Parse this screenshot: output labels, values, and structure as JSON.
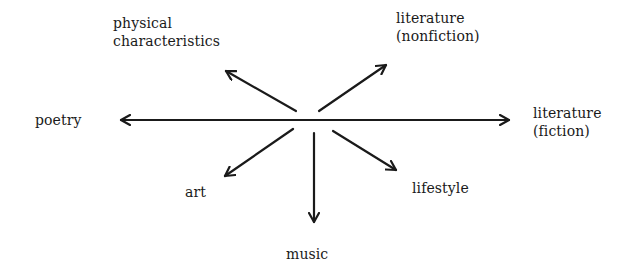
{
  "diagram": {
    "type": "radial-arrow-diagram",
    "ink_color": "#1a1a1a",
    "background": "#ffffff",
    "center": {
      "x": 314,
      "y": 120
    },
    "nodes": [
      {
        "id": "physical",
        "lines": [
          "physical",
          "characteristics"
        ],
        "direction": "up-left"
      },
      {
        "id": "lit-nonfiction",
        "lines": [
          "literature",
          "(nonfiction)"
        ],
        "direction": "up-right"
      },
      {
        "id": "poetry",
        "lines": [
          "poetry"
        ],
        "direction": "left"
      },
      {
        "id": "lit-fiction",
        "lines": [
          "literature",
          "(fiction)"
        ],
        "direction": "right"
      },
      {
        "id": "art",
        "lines": [
          "art"
        ],
        "direction": "down-left"
      },
      {
        "id": "lifestyle",
        "lines": [
          "lifestyle"
        ],
        "direction": "down-right"
      },
      {
        "id": "music",
        "lines": [
          "music"
        ],
        "direction": "down"
      }
    ]
  },
  "labels": {
    "physical": {
      "line1": "physical",
      "line2": "characteristics"
    },
    "lit_nonfiction": {
      "line1": "literature",
      "line2": "(nonfiction)"
    },
    "poetry": {
      "line1": "poetry"
    },
    "lit_fiction": {
      "line1": "literature",
      "line2": "(fiction)"
    },
    "art": {
      "line1": "art"
    },
    "lifestyle": {
      "line1": "lifestyle"
    },
    "music": {
      "line1": "music"
    }
  },
  "arrows": [
    {
      "name": "poetry-fiction-axis",
      "from": [
        121,
        120
      ],
      "to": [
        509,
        120
      ],
      "bidirectional": true
    },
    {
      "name": "arrow-physical",
      "from": [
        296,
        111
      ],
      "to": [
        226,
        71
      ]
    },
    {
      "name": "arrow-lit-nonfiction",
      "from": [
        319,
        111
      ],
      "to": [
        386,
        65
      ]
    },
    {
      "name": "arrow-art",
      "from": [
        293,
        129
      ],
      "to": [
        225,
        176
      ]
    },
    {
      "name": "arrow-lifestyle",
      "from": [
        333,
        131
      ],
      "to": [
        396,
        170
      ]
    },
    {
      "name": "arrow-music",
      "from": [
        314,
        133
      ],
      "to": [
        314,
        222
      ]
    }
  ]
}
